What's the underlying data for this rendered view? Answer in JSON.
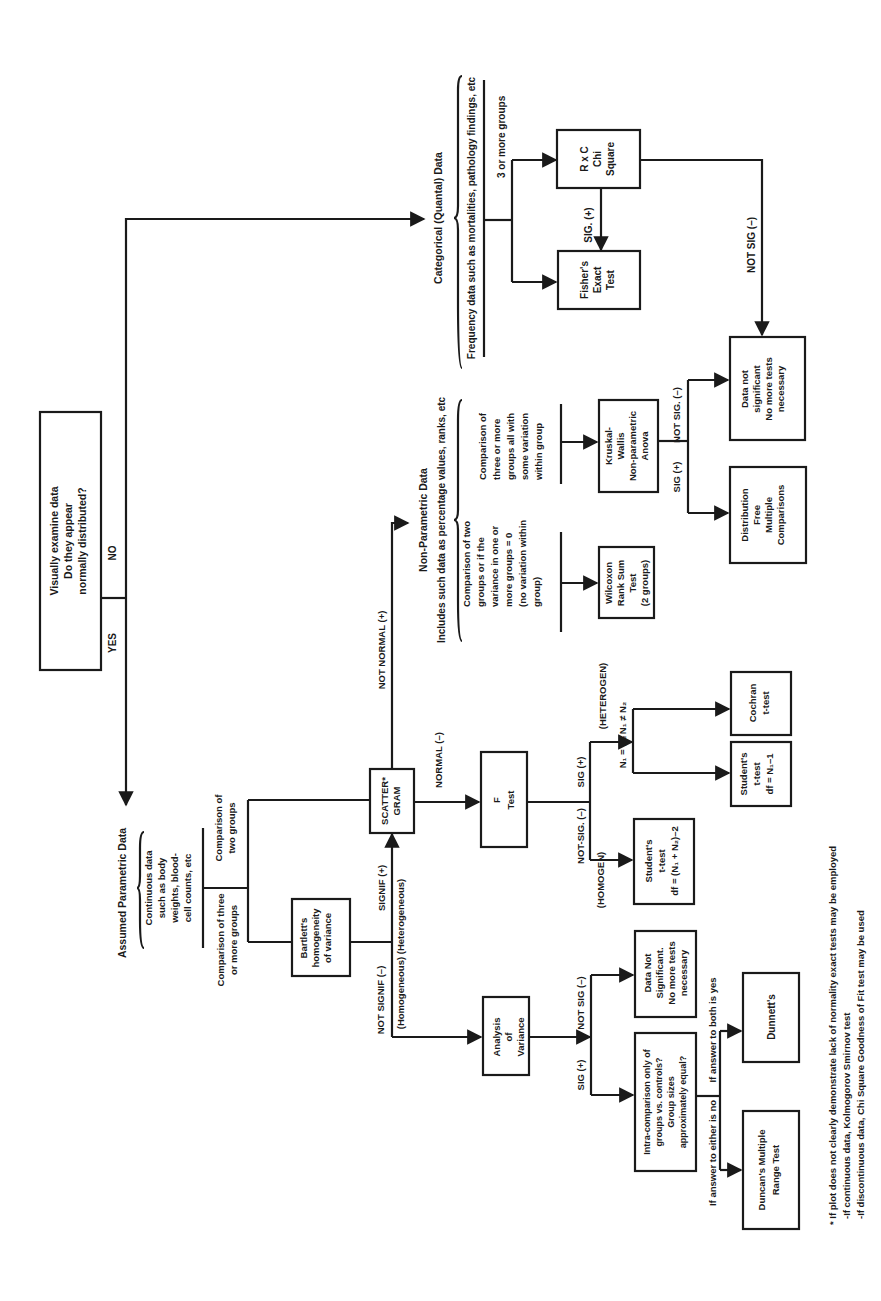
{
  "colors": {
    "ink": "#1a1a1a",
    "paper": "#ffffff"
  },
  "start": {
    "lines": [
      "Visually examine data",
      "Do they appear",
      "normally distributed?"
    ],
    "yes_label": "YES",
    "no_label": "NO"
  },
  "parametric": {
    "title": "Assumed Parametric Data",
    "description": [
      "Continuous data",
      "such as body",
      "weights, blood-",
      "cell counts, etc"
    ],
    "branch_three": [
      "Comparison of three",
      "or more groups"
    ],
    "branch_two": [
      "Comparison of",
      "two groups"
    ],
    "bartlett": [
      "Bartlett's",
      "homogeneity",
      "of variance"
    ],
    "not_signif_label": "NOT SIGNIF (–)",
    "homogeneous_label": "(Homogeneous) (Heterogeneous)",
    "signif_label": "SIGNIF (+)",
    "scattergram": [
      "SCATTER*",
      "GRAM"
    ],
    "not_normal_label": "NOT NORMAL (+)",
    "normal_label": "NORMAL (–)",
    "f_test": [
      "F",
      "Test"
    ],
    "not_sig_f_label": "NOT-SIG. (–)",
    "sig_f_label": "SIG (+)",
    "homogen_label": "(HOMOGEN)",
    "heterogen_label": "(HETEROGEN)",
    "n_equal_label": "N₁ = N₂",
    "n_unequal_label": "N₁ ≠ N₂",
    "students_homogen": [
      "Student's",
      "t-test",
      "df = (N₁ + N₂)–2"
    ],
    "students_hetero": [
      "Student's",
      "t-test",
      "df = N₁–1"
    ],
    "cochran": [
      "Cochran",
      "t-test"
    ],
    "anova": [
      "Analysis",
      "of",
      "Variance"
    ],
    "anova_sig_label": "SIG (+)",
    "anova_not_sig_label": "NOT SIG (–)",
    "data_not_sig": [
      "Data Not",
      "Significant.",
      "No more tests",
      "necessary"
    ],
    "intra_question": [
      "Intra-comparison only of",
      "groups vs. controls?",
      "Group sizes",
      "approximately equal?"
    ],
    "answer_no_label": "If answer to either is no",
    "answer_yes_label": "If answer to both is yes",
    "duncans": [
      "Duncan's Multiple",
      "Range Test"
    ],
    "dunnetts": [
      "Dunnett's"
    ]
  },
  "nonparametric": {
    "title": "Non-Parametric Data",
    "subtitle": "Includes such data as percentage values, ranks, etc",
    "branch_two": [
      "Comparison of two",
      "groups or if the",
      "variance in one or",
      "more groups = 0",
      "(no variation within",
      "group)"
    ],
    "branch_three": [
      "Comparison of",
      "three or more",
      "groups all with",
      "some variation",
      "within group"
    ],
    "wilcoxon": [
      "Wilcoxon",
      "Rank Sum",
      "Test",
      "(2 groups)"
    ],
    "kruskal": [
      "Kruskal-",
      "Wallis",
      "Non-parametric",
      "Anova"
    ],
    "sig_label": "SIG (+)",
    "not_sig_label": "NOT SIG. (–)",
    "distribution_free": [
      "Distribution",
      "Free",
      "Multiple",
      "Comparisons"
    ],
    "data_not_sig": [
      "Data not",
      "significant",
      "No more tests",
      "necessary"
    ]
  },
  "categorical": {
    "title": "Categorical (Quantal) Data",
    "subtitle": "Frequency data such as mortalities, pathology findings, etc",
    "branch_label": "3 or more groups",
    "rxc": [
      "R x C",
      "Chi",
      "Square"
    ],
    "sig_label": "SIG. (+)",
    "fisher": [
      "Fisher's",
      "Exact",
      "Test"
    ],
    "not_sig_label": "NOT SIG (–)"
  },
  "footnotes": [
    "* If plot does not clearly demonstrate lack of normality exact tests may be employed",
    "-If continuous data, Kolmogorov Smirnov test",
    "-If discontinuous data, Chi Square Goodness of Fit test may be used"
  ]
}
